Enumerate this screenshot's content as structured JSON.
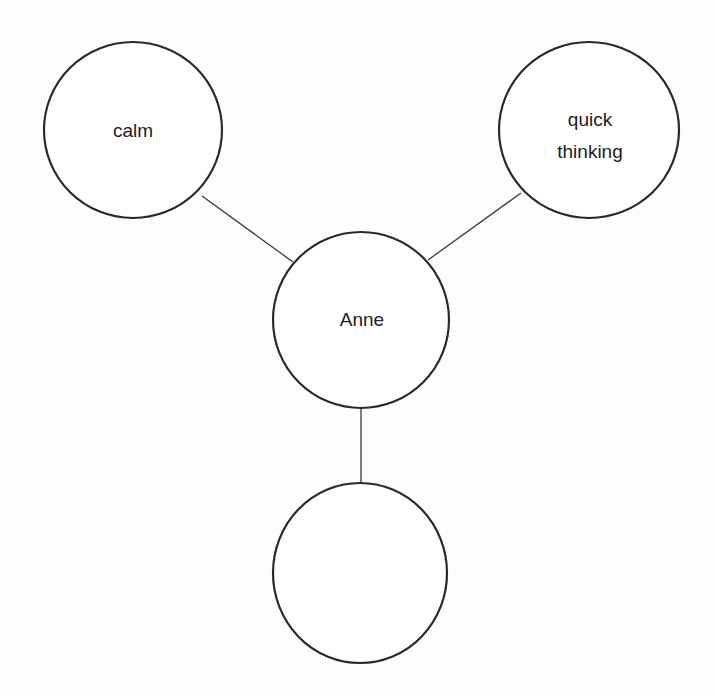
{
  "diagram": {
    "type": "mind-map",
    "center": {
      "id": "anne",
      "label": "Anne",
      "cx": 361,
      "cy": 320,
      "rx": 88,
      "ry": 88
    },
    "nodes": [
      {
        "id": "calm",
        "lines": [
          "calm"
        ],
        "cx": 133,
        "cy": 130,
        "rx": 89,
        "ry": 88
      },
      {
        "id": "quick-thinking",
        "lines": [
          "quick",
          "thinking"
        ],
        "cx": 589,
        "cy": 130,
        "rx": 90,
        "ry": 88
      },
      {
        "id": "empty",
        "lines": [],
        "cx": 360,
        "cy": 573,
        "rx": 87,
        "ry": 90
      }
    ],
    "edges": [
      {
        "from": "calm",
        "to": "anne",
        "x1": 202,
        "y1": 196,
        "x2": 293,
        "y2": 262
      },
      {
        "from": "quick-thinking",
        "to": "anne",
        "x1": 521,
        "y1": 193,
        "x2": 428,
        "y2": 260
      },
      {
        "from": "anne",
        "to": "empty",
        "x1": 361,
        "y1": 408,
        "x2": 361,
        "y2": 483
      }
    ],
    "labels": {
      "anne": "Anne",
      "calm": "calm",
      "quick_line1": "quick",
      "quick_line2": "thinking"
    }
  }
}
